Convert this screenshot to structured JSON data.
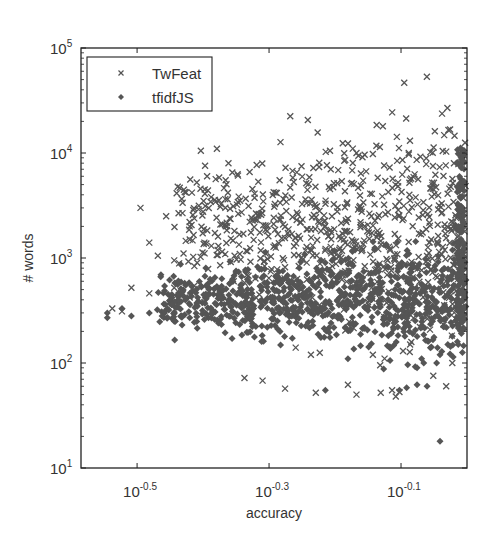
{
  "chart_data": {
    "type": "scatter",
    "title": "",
    "xlabel": "accuracy",
    "ylabel": "# words",
    "xscale": "log",
    "yscale": "log",
    "xlim_log10": [
      -0.585,
      0.0
    ],
    "ylim": [
      10,
      100000
    ],
    "grid": false,
    "legend_position": "upper left",
    "x_ticks": [
      {
        "base": "10",
        "exp": "-0.5",
        "log": -0.5
      },
      {
        "base": "10",
        "exp": "-0.3",
        "log": -0.3
      },
      {
        "base": "10",
        "exp": "-0.1",
        "log": -0.1
      }
    ],
    "y_ticks": [
      {
        "base": "10",
        "exp": "1",
        "log": 1
      },
      {
        "base": "10",
        "exp": "2",
        "log": 2
      },
      {
        "base": "10",
        "exp": "3",
        "log": 3
      },
      {
        "base": "10",
        "exp": "4",
        "log": 4
      },
      {
        "base": "10",
        "exp": "5",
        "log": 5
      }
    ],
    "marker_color": "#555555",
    "series": [
      {
        "name": "TwFeat",
        "marker": "x",
        "cluster": {
          "x_log_range": [
            -0.45,
            0.0
          ],
          "y_log_center": 3.3,
          "y_log_spread": 0.45,
          "count": 700,
          "x_bias": 1.4,
          "seed": 7
        },
        "points": [
          [
            0.395,
            10500
          ],
          [
            0.435,
            8000
          ],
          [
            0.48,
            7700
          ],
          [
            0.375,
            4200
          ],
          [
            0.32,
            3000
          ],
          [
            0.35,
            2500
          ],
          [
            0.38,
            2000
          ],
          [
            0.33,
            1400
          ],
          [
            0.38,
            1500
          ],
          [
            0.4,
            1400
          ],
          [
            0.42,
            1300
          ],
          [
            0.34,
            1050
          ],
          [
            0.36,
            950
          ],
          [
            0.39,
            900
          ],
          [
            0.31,
            520
          ],
          [
            0.33,
            460
          ],
          [
            0.36,
            520
          ],
          [
            0.38,
            420
          ],
          [
            0.4,
            380
          ],
          [
            0.29,
            330
          ],
          [
            0.3,
            310
          ],
          [
            0.46,
            72
          ],
          [
            0.49,
            68
          ],
          [
            0.53,
            57
          ],
          [
            0.59,
            52
          ],
          [
            0.66,
            62
          ],
          [
            0.68,
            50
          ],
          [
            0.74,
            52
          ],
          [
            0.77,
            55
          ],
          [
            0.78,
            48
          ],
          [
            0.79,
            53
          ],
          [
            0.72,
            120
          ],
          [
            0.75,
            110
          ],
          [
            0.8,
            130
          ],
          [
            0.82,
            150
          ],
          [
            0.93,
            60
          ],
          [
            0.95,
            100
          ],
          [
            0.58,
            120
          ],
          [
            0.55,
            140
          ],
          [
            0.62,
            10500
          ],
          [
            0.68,
            10000
          ],
          [
            0.72,
            9800
          ],
          [
            0.85,
            9200
          ],
          [
            0.88,
            10200
          ],
          [
            0.93,
            10300
          ]
        ]
      },
      {
        "name": "tfidfJS",
        "marker": "diamond",
        "cluster": {
          "x_log_range": [
            -0.47,
            0.0
          ],
          "y_log_center": 2.6,
          "y_log_spread": 0.22,
          "count": 900,
          "x_bias": 1.2,
          "seed": 19
        },
        "edge_column": {
          "x_log": -0.003,
          "y_log_range": [
            2.3,
            4.05
          ],
          "count": 160,
          "seed": 31
        },
        "points": [
          [
            0.285,
            300
          ],
          [
            0.285,
            270
          ],
          [
            0.3,
            330
          ],
          [
            0.31,
            280
          ],
          [
            0.33,
            300
          ],
          [
            0.345,
            280
          ],
          [
            0.36,
            250
          ],
          [
            0.38,
            270
          ],
          [
            0.4,
            260
          ],
          [
            0.37,
            230
          ],
          [
            0.42,
            240
          ],
          [
            0.61,
            55
          ],
          [
            0.79,
            55
          ],
          [
            0.81,
            58
          ],
          [
            0.84,
            62
          ],
          [
            0.87,
            60
          ],
          [
            0.91,
            18
          ],
          [
            0.88,
            140
          ],
          [
            0.91,
            120
          ],
          [
            0.86,
            100
          ],
          [
            0.84,
            90
          ],
          [
            0.66,
            110
          ],
          [
            0.95,
            180
          ],
          [
            0.97,
            150
          ],
          [
            0.62,
            175
          ]
        ]
      }
    ]
  },
  "legend": {
    "items": [
      {
        "label": "TwFeat",
        "marker": "x"
      },
      {
        "label": "tfidfJS",
        "marker": "diamond"
      }
    ]
  },
  "axes": {
    "xlabel": "accuracy",
    "ylabel": "# words"
  }
}
